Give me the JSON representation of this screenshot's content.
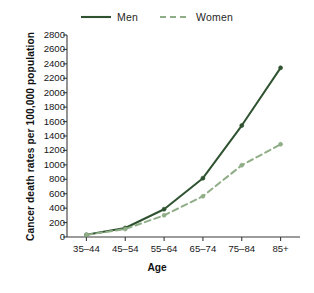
{
  "chart_data": {
    "type": "line",
    "title": "",
    "subtitle": "",
    "xlabel": "Age",
    "ylabel": "Cancer death rates per 100,000 population",
    "categories": [
      "35–44",
      "45–54",
      "55–64",
      "65–74",
      "75–84",
      "85+"
    ],
    "ylim": [
      0,
      2800
    ],
    "ytick_step": 200,
    "yticks": [
      0,
      200,
      400,
      600,
      800,
      1000,
      1200,
      1400,
      1600,
      1800,
      2000,
      2200,
      2400,
      2600,
      2800
    ],
    "ytick_labels": [
      "0",
      "200",
      "400",
      "600",
      "800",
      "1000",
      "1200",
      "1400",
      "1600",
      "1800",
      "2000",
      "2200",
      "2400",
      "2600",
      "2800"
    ],
    "grid": false,
    "legend_position": "top-center",
    "series": [
      {
        "name": "Men",
        "style": "solid",
        "color": "#2f5230",
        "marker": "dot",
        "values": [
          30,
          125,
          385,
          815,
          1545,
          2345
        ]
      },
      {
        "name": "Women",
        "style": "dashed",
        "color": "#8fad86",
        "marker": "dot",
        "values": [
          30,
          110,
          300,
          565,
          995,
          1285
        ]
      }
    ]
  },
  "legend": {
    "entries": [
      {
        "label": "Men",
        "icon": "solid-line-swatch"
      },
      {
        "label": "Women",
        "icon": "dashed-line-swatch"
      }
    ]
  },
  "colors": {
    "men": "#2f5230",
    "women": "#8fad86",
    "axis": "#3a3a3a",
    "text": "#171717",
    "background": "#ffffff"
  }
}
